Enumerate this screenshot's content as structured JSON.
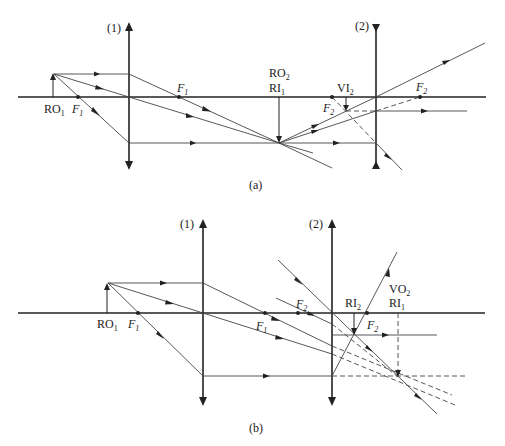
{
  "figure_a": {
    "caption": "(a)",
    "lens1_label": "(1)",
    "lens2_label": "(2)",
    "labels": {
      "ro1": {
        "main": "RO",
        "sub": "1"
      },
      "f1_left": {
        "main": "F",
        "sub": "1"
      },
      "f1_right": {
        "main": "F",
        "sub": "1"
      },
      "ro2": {
        "main": "RO",
        "sub": "2"
      },
      "ri1": {
        "main": "RI",
        "sub": "1"
      },
      "vi2": {
        "main": "VI",
        "sub": "2"
      },
      "f2_left": {
        "main": "F",
        "sub": "2"
      },
      "f2_right": {
        "main": "F",
        "sub": "2"
      }
    },
    "lens1_type": "converging",
    "lens2_type": "diverging"
  },
  "figure_b": {
    "caption": "(b)",
    "lens1_label": "(1)",
    "lens2_label": "(2)",
    "labels": {
      "ro1": {
        "main": "RO",
        "sub": "1"
      },
      "f1_left": {
        "main": "F",
        "sub": "1"
      },
      "f1_right": {
        "main": "F",
        "sub": "1"
      },
      "f2_left": {
        "main": "F",
        "sub": "2"
      },
      "ri2": {
        "main": "RI",
        "sub": "2"
      },
      "f2_right": {
        "main": "F",
        "sub": "2"
      },
      "vo2": {
        "main": "VO",
        "sub": "2"
      },
      "ri1": {
        "main": "RI",
        "sub": "1"
      }
    },
    "lens1_type": "converging",
    "lens2_type": "converging"
  },
  "colors": {
    "line": "#222222",
    "ray": "#444444"
  }
}
